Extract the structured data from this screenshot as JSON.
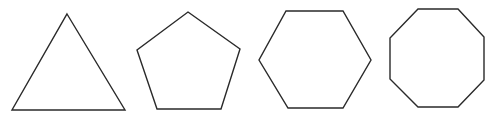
{
  "figure": {
    "stroke_color": "#2a2a2a",
    "background_color": "#ffffff",
    "shapes": [
      {
        "name": "triangle",
        "sides": 3
      },
      {
        "name": "pentagon",
        "sides": 5
      },
      {
        "name": "hexagon",
        "sides": 6
      },
      {
        "name": "octagon",
        "sides": 8
      }
    ]
  }
}
